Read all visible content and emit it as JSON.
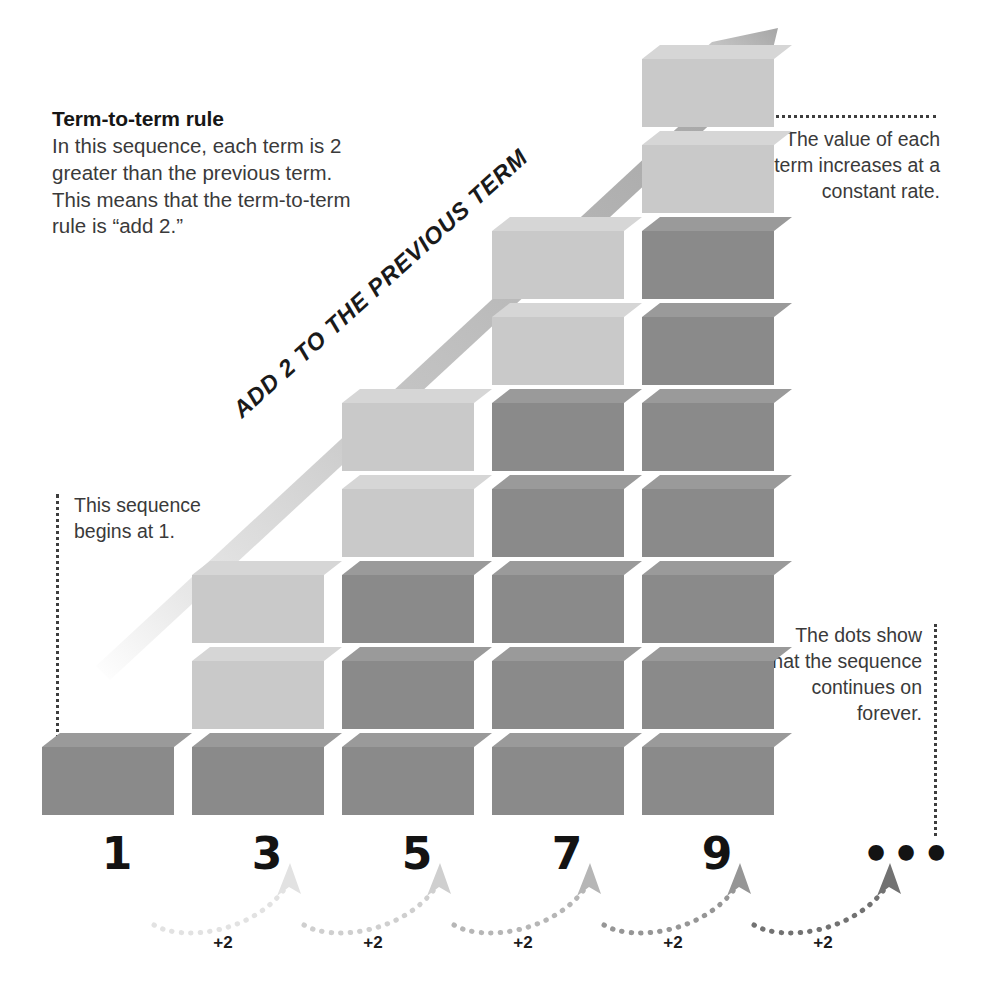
{
  "rule": {
    "heading": "Term-to-term rule",
    "body": "In this sequence, each term is 2 greater than the previous term. This means that the term-to-term rule is “add 2.”"
  },
  "annotations": {
    "top_right": "The value of each term increases at a constant rate.",
    "left": "This sequence begins at 1.",
    "bottom_right": "The dots show that the sequence continues on forever."
  },
  "arrow_label": "ADD 2 TO THE PREVIOUS TERM",
  "ellipsis": "•••",
  "colors": {
    "block_dark_front": "#8a8a8a",
    "block_dark_top": "#9a9a9a",
    "block_dark_side": "#6f6f6f",
    "block_light_front": "#c9c9c9",
    "block_light_top": "#d6d6d6",
    "block_light_side": "#b4b4b4",
    "arrow": "#b0b0b0",
    "text": "#3a3a3a",
    "heading": "#161616",
    "dotted": "#3d3d3d"
  },
  "chart_data": {
    "type": "bar",
    "xlabel": "Term position",
    "ylabel": "Value of term (number of blocks)",
    "categories": [
      "1",
      "2",
      "3",
      "4",
      "5"
    ],
    "tick_labels": [
      "1",
      "3",
      "5",
      "7",
      "9",
      "•••"
    ],
    "values": [
      1,
      3,
      5,
      7,
      9
    ],
    "ylim": [
      0,
      10
    ],
    "grid": false,
    "legend": null,
    "annotations": [
      "This sequence begins at 1.",
      "The value of each term increases at a constant rate.",
      "The dots show that the sequence continues on forever.",
      "ADD 2 TO THE PREVIOUS TERM"
    ],
    "step_labels": [
      "+2",
      "+2",
      "+2",
      "+2",
      "+2"
    ],
    "first_term": 1,
    "common_difference": 2,
    "highlighted_top_blocks_per_bar": [
      0,
      2,
      2,
      2,
      2
    ]
  },
  "bars": [
    {
      "label": "1",
      "count": 1,
      "light_top": 0
    },
    {
      "label": "3",
      "count": 3,
      "light_top": 2
    },
    {
      "label": "5",
      "count": 5,
      "light_top": 2
    },
    {
      "label": "7",
      "count": 7,
      "light_top": 2
    },
    {
      "label": "9",
      "count": 9,
      "light_top": 2
    }
  ],
  "steps": [
    {
      "label": "+2"
    },
    {
      "label": "+2"
    },
    {
      "label": "+2"
    },
    {
      "label": "+2"
    },
    {
      "label": "+2"
    }
  ]
}
